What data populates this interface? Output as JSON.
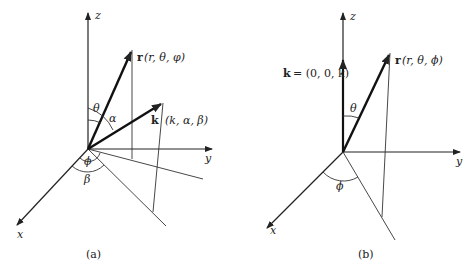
{
  "figure": {
    "panel_a": {
      "caption": "(a)",
      "axes": {
        "x": "x",
        "y": "y",
        "z": "z"
      },
      "vectors": {
        "r_label": "r",
        "r_coords": "(r, θ, φ)",
        "k_label": "k",
        "k_coords": "(k, α, β)"
      },
      "angles": {
        "theta": "θ",
        "alpha": "α",
        "phi": "ϕ",
        "beta": "β"
      }
    },
    "panel_b": {
      "caption": "(b)",
      "axes": {
        "x": "x",
        "y": "y",
        "z": "z"
      },
      "vectors": {
        "r_label": "r",
        "r_coords": "(r, θ, ϕ)",
        "k_label": "k",
        "k_eq": "= (0, 0, k)"
      },
      "angles": {
        "theta": "θ",
        "phi": "ϕ"
      }
    }
  }
}
